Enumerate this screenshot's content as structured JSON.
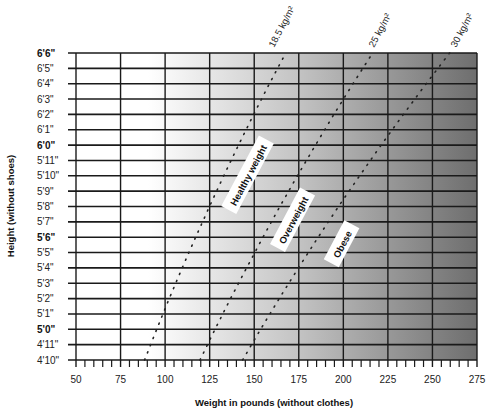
{
  "chart_data": {
    "type": "line",
    "title": "",
    "xlabel": "Weight in pounds (without clothes)",
    "ylabel": "Height (without shoes)",
    "xlim": [
      50,
      275
    ],
    "x_ticks": [
      50,
      75,
      100,
      125,
      150,
      175,
      200,
      225,
      250,
      275
    ],
    "x_minor_step": 5,
    "y_ticks": [
      "4'10\"",
      "4'11\"",
      "5'0\"",
      "5'1\"",
      "5'2\"",
      "5'3\"",
      "5'4\"",
      "5'5\"",
      "5'6\"",
      "5'7\"",
      "5'8\"",
      "5'9\"",
      "5'10\"",
      "5'11\"",
      "6'0\"",
      "6'1\"",
      "6'2\"",
      "6'3\"",
      "6'4\"",
      "6'5\"",
      "6'6\""
    ],
    "y_ticks_bold": [
      "5'0\"",
      "5'6\"",
      "6'0\"",
      "6'6\""
    ],
    "y_inches_range": [
      58,
      78
    ],
    "grid": true,
    "background": "horizontal gradient white to dark gray",
    "series": [
      {
        "name": "18.5 kg/m²",
        "style": "dotted",
        "bmi": 18.5,
        "points": [
          [
            88.5,
            58
          ],
          [
            95.3,
            60
          ],
          [
            102.3,
            62
          ],
          [
            109.6,
            64
          ],
          [
            117.1,
            66
          ],
          [
            124.9,
            68
          ],
          [
            132.9,
            70
          ],
          [
            141.2,
            72
          ],
          [
            149.7,
            74
          ],
          [
            158.5,
            76
          ],
          [
            167.7,
            78
          ]
        ]
      },
      {
        "name": "25 kg/m²",
        "style": "dotted",
        "bmi": 25,
        "points": [
          [
            119.6,
            58
          ],
          [
            128.0,
            60
          ],
          [
            136.7,
            62
          ],
          [
            145.7,
            64
          ],
          [
            154.9,
            66
          ],
          [
            164.4,
            68
          ],
          [
            174.2,
            70
          ],
          [
            184.4,
            72
          ],
          [
            194.7,
            74
          ],
          [
            205.4,
            76
          ],
          [
            216.4,
            78
          ]
        ]
      },
      {
        "name": "30 kg/m²",
        "style": "dotted",
        "bmi": 30,
        "points": [
          [
            143.5,
            58
          ],
          [
            153.6,
            60
          ],
          [
            164.0,
            62
          ],
          [
            174.8,
            64
          ],
          [
            185.9,
            66
          ],
          [
            197.3,
            68
          ],
          [
            209.1,
            70
          ],
          [
            221.2,
            72
          ],
          [
            233.7,
            74
          ],
          [
            246.5,
            76
          ],
          [
            259.6,
            78
          ]
        ]
      }
    ],
    "annotations": [
      {
        "text": "Healthy weight",
        "x": 132,
        "y_in": 67.5,
        "angle": -62
      },
      {
        "text": "Overweight",
        "x": 176,
        "y_in": 65.5,
        "angle": -62
      },
      {
        "text": "Obese",
        "x": 200,
        "y_in": 64.5,
        "angle": -62
      }
    ]
  },
  "labels": {
    "bmi_18": "18.5 kg/m²",
    "bmi_25": "25 kg/m²",
    "bmi_30": "30 kg/m²",
    "healthy": "Healthy weight",
    "overweight": "Overweight",
    "obese": "Obese",
    "xlabel": "Weight in pounds (without clothes)",
    "ylabel": "Height (without shoes)"
  },
  "colors": {
    "gradient_start": "#ffffff",
    "gradient_mid": "#c4c4c4",
    "gradient_end": "#6e6e6e",
    "grid": "#1a1a1a",
    "label_box": "#ffffff"
  }
}
